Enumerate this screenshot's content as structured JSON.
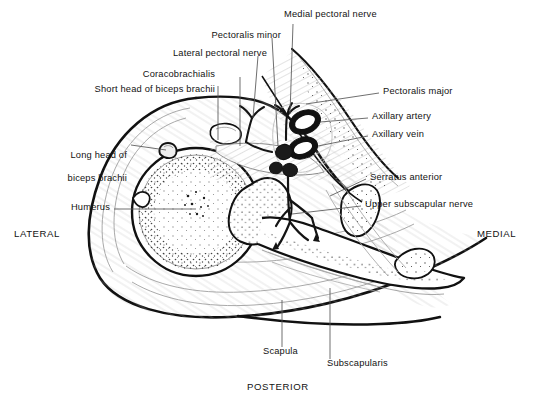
{
  "figure": {
    "background_color": "#ffffff",
    "ink_color": "#121212",
    "leader_color": "#555555"
  },
  "orientation_labels": [
    {
      "name": "lateral",
      "text": "LATERAL",
      "x": 14,
      "y": 228
    },
    {
      "name": "medial",
      "text": "MEDIAL",
      "x": 477,
      "y": 228
    },
    {
      "name": "posterior",
      "text": "POSTERIOR",
      "x": 247,
      "y": 386
    }
  ],
  "labels": [
    {
      "id": "short-head-biceps",
      "text": "Short head of biceps brachii",
      "align": "right",
      "x": 215,
      "y": 89,
      "lines": [
        "Short head of biceps brachii"
      ]
    },
    {
      "id": "coracobrachialis",
      "text": "Coracobrachialis",
      "align": "right",
      "x": 215,
      "y": 74,
      "lines": [
        "Coracobrachialis"
      ]
    },
    {
      "id": "lateral-pectoral-nerve",
      "text": "Lateral pectoral nerve",
      "align": "right",
      "x": 267,
      "y": 53,
      "lines": [
        "Lateral pectoral nerve"
      ]
    },
    {
      "id": "pectoralis-minor",
      "text": "Pectoralis minor",
      "align": "right",
      "x": 281,
      "y": 35,
      "lines": [
        "Pectoralis minor"
      ]
    },
    {
      "id": "medial-pectoral-nerve",
      "text": "Medial pectoral nerve",
      "align": "left",
      "x": 284,
      "y": 14,
      "lines": [
        "Medial pectoral nerve"
      ]
    },
    {
      "id": "long-head-biceps",
      "text": "Long head of biceps brachii",
      "align": "right",
      "x": 127,
      "y": 143,
      "lines": [
        "Long head of",
        "biceps brachii"
      ]
    },
    {
      "id": "humerus",
      "text": "Humerus",
      "align": "right",
      "x": 110,
      "y": 207,
      "lines": [
        "Humerus"
      ]
    },
    {
      "id": "pectoralis-major",
      "text": "Pectoralis major",
      "align": "left",
      "x": 383,
      "y": 91,
      "lines": [
        "Pectoralis major"
      ]
    },
    {
      "id": "axillary-artery",
      "text": "Axillary artery",
      "align": "left",
      "x": 372,
      "y": 116,
      "lines": [
        "Axillary artery"
      ]
    },
    {
      "id": "axillary-vein",
      "text": "Axillary vein",
      "align": "left",
      "x": 372,
      "y": 134,
      "lines": [
        "Axillary vein"
      ]
    },
    {
      "id": "serratus-anterior",
      "text": "Serratus anterior",
      "align": "left",
      "x": 370,
      "y": 177,
      "lines": [
        "Serratus anterior"
      ]
    },
    {
      "id": "upper-subscapular-nerve",
      "text": "Upper subscapular nerve",
      "align": "left",
      "x": 365,
      "y": 204,
      "lines": [
        "Upper subscapular nerve"
      ]
    },
    {
      "id": "scapula",
      "text": "Scapula",
      "align": "left",
      "x": 263,
      "y": 351,
      "lines": [
        "Scapula"
      ]
    },
    {
      "id": "subscapularis",
      "text": "Subscapularis",
      "align": "left",
      "x": 327,
      "y": 363,
      "lines": [
        "Subscapularis"
      ]
    }
  ],
  "structures": [
    {
      "name": "humerus-head",
      "kind": "bone",
      "description": "Large round head of humerus with cancellous stippling"
    },
    {
      "name": "scapula",
      "kind": "bone",
      "description": "Blade of scapula extending medially and posteriorly"
    },
    {
      "name": "coracoid-process",
      "kind": "bone",
      "description": "Small bone section anterior to humeral head"
    },
    {
      "name": "rib-section",
      "kind": "bone",
      "description": "Rib cross-sections at medial margin"
    },
    {
      "name": "pectoralis-major",
      "kind": "muscle",
      "description": "Anterior muscle sheet sweeping medially"
    },
    {
      "name": "pectoralis-minor",
      "kind": "muscle",
      "description": "Deep anterior muscle beneath pectoralis major"
    },
    {
      "name": "serratus-anterior",
      "kind": "muscle",
      "description": "Muscle along the thoracic wall"
    },
    {
      "name": "subscapularis",
      "kind": "muscle",
      "description": "Muscle on anterior surface of scapula"
    },
    {
      "name": "deltoid",
      "kind": "muscle",
      "description": "Muscle wrapping the lateral humerus"
    },
    {
      "name": "axillary-artery",
      "kind": "vessel",
      "description": "Thick-walled oval vessel, superior of the pair"
    },
    {
      "name": "axillary-vein",
      "kind": "vessel",
      "description": "Thick-walled oval vessel, inferior of the pair"
    },
    {
      "name": "brachial-plexus",
      "kind": "nerve",
      "description": "Dark solid nerve cords with branching tree"
    }
  ]
}
